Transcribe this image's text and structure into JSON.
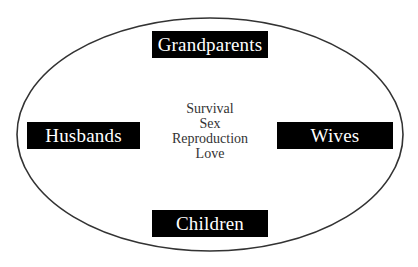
{
  "diagram": {
    "ellipse": {
      "cx": 210,
      "cy": 134.5,
      "rx": 193,
      "ry": 116.5,
      "stroke": "#333333",
      "stroke_width": 1.6
    },
    "nodes": {
      "top": {
        "label": "Grandparents"
      },
      "left": {
        "label": "Husbands"
      },
      "right": {
        "label": "Wives"
      },
      "bottom": {
        "label": "Children"
      }
    },
    "center_items": [
      "Survival",
      "Sex",
      "Reproduction",
      "Love"
    ],
    "colors": {
      "box_background": "#000000",
      "box_text": "#ffffff",
      "center_text": "#333333",
      "background": "#ffffff"
    }
  }
}
